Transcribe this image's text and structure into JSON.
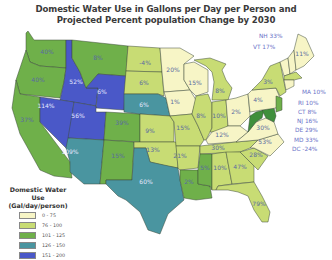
{
  "title_line1": "Domestic Water Use in Gallons per Day per Person and",
  "title_line2": "Projected Percent population Change by 2030",
  "colors": {
    "c0_75": "#f7f5c6",
    "c76_100": "#c8dc74",
    "c101_125": "#6fb04a",
    "c126_150": "#4a95a0",
    "c151_200": "#4a58c8"
  },
  "legend": {
    "title_line1": "Domestic Water Use",
    "title_line2": "(Gal/day/person)",
    "items": [
      {
        "range": "0 - 75",
        "color": "#f7f5c6"
      },
      {
        "range": "76 - 100",
        "color": "#c8dc74"
      },
      {
        "range": "101 - 125",
        "color": "#6fb04a"
      },
      {
        "range": "126 - 150",
        "color": "#4a95a0"
      },
      {
        "range": "151 - 200",
        "color": "#4a58c8"
      }
    ]
  },
  "states": {
    "WA": "40%",
    "OR": "40%",
    "CA": "37%",
    "ID": "52%",
    "NV": "114%",
    "MT": "8%",
    "WY": "6%",
    "UT": "56%",
    "AZ": "109%",
    "CO": "39%",
    "NM": "15%",
    "ND": "-4%",
    "SD": "6%",
    "NE": "6%",
    "KS": "9%",
    "OK": "13%",
    "TX": "60%",
    "MN": "20%",
    "IA": "1%",
    "MO": "15%",
    "AR": "21%",
    "LA": "2%",
    "WI": "15%",
    "IL": "8%",
    "MI": "8%",
    "IN": "10%",
    "OH": "2%",
    "KY": "12%",
    "TN": "30%",
    "MS": "5%",
    "AL": "10%",
    "GA": "47%",
    "FL": "79%",
    "SC": "28%",
    "NC": "53%",
    "VA": "30%",
    "WV": "",
    "PA": "4%",
    "NY": "3%",
    "ME": "11%"
  },
  "side_labels": [
    {
      "text": "NH 33%",
      "x": 259,
      "y": 36
    },
    {
      "text": "VT 17%",
      "x": 253,
      "y": 47
    },
    {
      "text": "MA 10%",
      "x": 302,
      "y": 92
    },
    {
      "text": "RI 10%",
      "x": 298,
      "y": 103
    },
    {
      "text": "CT 8%",
      "x": 298,
      "y": 112
    },
    {
      "text": "NJ 16%",
      "x": 297,
      "y": 121
    },
    {
      "text": "DE 29%",
      "x": 295,
      "y": 130
    },
    {
      "text": "MD 33%",
      "x": 294,
      "y": 140
    },
    {
      "text": "DC -24%",
      "x": 292,
      "y": 149
    }
  ]
}
